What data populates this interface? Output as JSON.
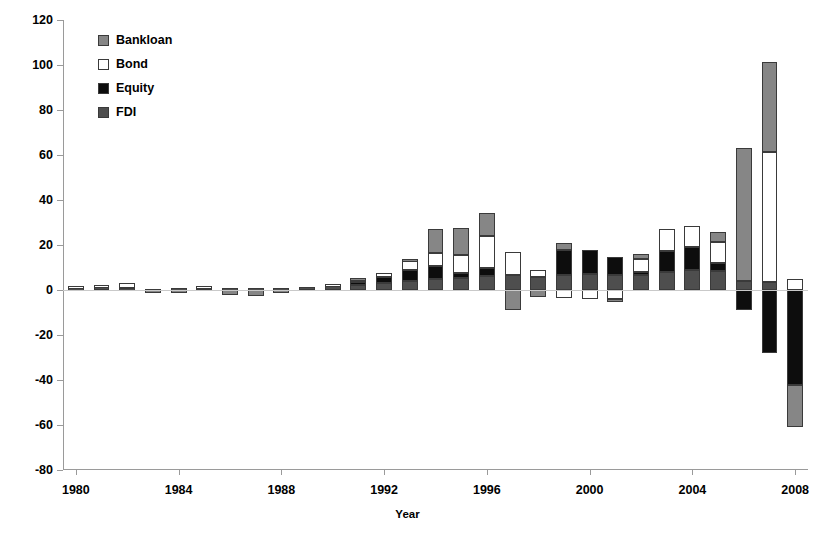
{
  "chart_data": {
    "type": "bar",
    "subtype": "stacked-bar-with-negative",
    "title": "",
    "xlabel": "Year",
    "ylabel": "",
    "ylim": [
      -80,
      120
    ],
    "ytick_step": 20,
    "yticks": [
      120,
      100,
      80,
      60,
      40,
      20,
      0,
      -20,
      -40,
      -60,
      -80
    ],
    "ytick_labels": [
      "120",
      "100",
      "80",
      "60",
      "40",
      "20",
      "0",
      "-20",
      "-40",
      "-60",
      "-80"
    ],
    "xlim": [
      1979.5,
      2008.5
    ],
    "xticks": [
      1980,
      1984,
      1988,
      1992,
      1996,
      2000,
      2004,
      2008
    ],
    "xtick_labels": [
      "1980",
      "1984",
      "1988",
      "1992",
      "1996",
      "2000",
      "2004",
      "2008"
    ],
    "grid": false,
    "legend_position": "top-left-inside",
    "categories": [
      1980,
      1981,
      1982,
      1983,
      1984,
      1985,
      1986,
      1987,
      1988,
      1989,
      1990,
      1991,
      1992,
      1993,
      1994,
      1995,
      1996,
      1997,
      1998,
      1999,
      2000,
      2001,
      2002,
      2003,
      2004,
      2005,
      2006,
      2007,
      2008
    ],
    "series": [
      {
        "name": "FDI",
        "color": "#4e4e4e",
        "values": [
          1.0,
          1.2,
          1.0,
          0.6,
          0.8,
          1.2,
          0.8,
          0.8,
          1.0,
          1.4,
          2.0,
          2.4,
          3.2,
          4.2,
          4.8,
          5.4,
          6.2,
          6.8,
          5.8,
          6.5,
          7.0,
          6.8,
          6.5,
          8.0,
          9.0,
          8.5,
          4.0,
          3.5,
          0.0
        ]
      },
      {
        "name": "Equity",
        "color": "#0d0d0d",
        "values": [
          0.0,
          0.0,
          0.0,
          0.0,
          0.0,
          0.0,
          0.0,
          0.0,
          0.0,
          0.0,
          0.0,
          1.2,
          2.5,
          4.5,
          6.0,
          2.0,
          3.5,
          0.0,
          0.0,
          11.5,
          11.0,
          8.0,
          1.5,
          9.5,
          10.0,
          3.5,
          -9.0,
          -28.0,
          -42.0
        ]
      },
      {
        "name": "Bond",
        "color": "#ffffff",
        "values": [
          1.0,
          1.2,
          2.0,
          0.0,
          0.0,
          0.8,
          0.0,
          0.0,
          0.0,
          0.0,
          0.6,
          1.4,
          2.0,
          4.5,
          5.5,
          8.0,
          14.5,
          10.0,
          3.0,
          -3.5,
          -4.0,
          -4.0,
          6.0,
          9.5,
          9.5,
          9.5,
          0.0,
          58.0,
          5.0
        ]
      },
      {
        "name": "Bankloan",
        "color": "#868686",
        "values": [
          0.0,
          0.0,
          0.0,
          -0.8,
          -0.5,
          0.0,
          -2.0,
          -2.5,
          -1.5,
          0.0,
          0.0,
          0.5,
          0.0,
          0.5,
          11.0,
          12.0,
          10.0,
          -9.0,
          -3.0,
          3.0,
          0.0,
          -1.5,
          2.0,
          0.0,
          0.0,
          4.5,
          59.0,
          40.0,
          -19.0
        ]
      }
    ]
  },
  "legend": {
    "items": [
      {
        "label": "Bankloan",
        "swatch": "bankloan-swatch",
        "color": "#868686"
      },
      {
        "label": "Bond",
        "swatch": "bond-swatch",
        "color": "#ffffff"
      },
      {
        "label": "Equity",
        "swatch": "equity-swatch",
        "color": "#0d0d0d"
      },
      {
        "label": "FDI",
        "swatch": "fdi-swatch",
        "color": "#4e4e4e"
      }
    ]
  },
  "axes": {
    "x_title": "Year"
  }
}
